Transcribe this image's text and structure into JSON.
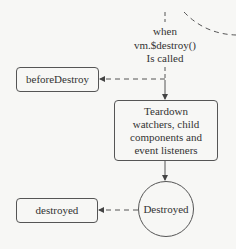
{
  "diagram": {
    "trigger_label": [
      "when",
      "vm.$destroy()",
      "Is called"
    ],
    "nodes": {
      "before_destroy": "beforeDestroy",
      "teardown": [
        "Teardown",
        "watchers, child",
        "components and",
        "event listeners"
      ],
      "destroyed_state": "Destroyed",
      "destroyed_hook": "destroyed"
    },
    "colors": {
      "line": "#555555",
      "background": "#f7f7f5",
      "text": "#333333"
    }
  }
}
